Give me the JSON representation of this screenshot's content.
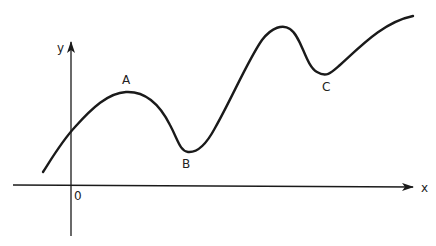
{
  "diagram": {
    "type": "function-curve-sketch",
    "axes": {
      "x_label": "x",
      "y_label": "y",
      "origin_label": "0"
    },
    "points": [
      {
        "id": "A",
        "label": "A",
        "kind": "local maximum"
      },
      {
        "id": "B",
        "label": "B",
        "kind": "local minimum"
      },
      {
        "id": "C",
        "label": "C",
        "kind": "local minimum"
      }
    ],
    "colors": {
      "stroke": "#1a1a1a",
      "text": "#222222",
      "background": "#ffffff"
    }
  }
}
